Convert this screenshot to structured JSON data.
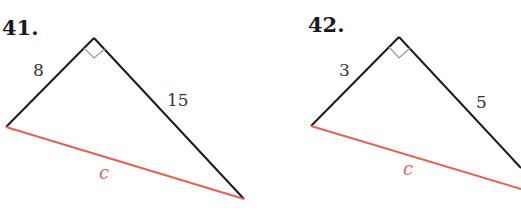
{
  "problems": [
    {
      "number": "41.",
      "leg_a": "8",
      "leg_b": "15",
      "hypotenuse": "c"
    },
    {
      "number": "42.",
      "leg_a": "3",
      "leg_b": "5",
      "hypotenuse": "c"
    }
  ],
  "colors": {
    "legs": "#1a1a1a",
    "hypotenuse": "#e8604f",
    "right_angle_mark": "#999999"
  }
}
